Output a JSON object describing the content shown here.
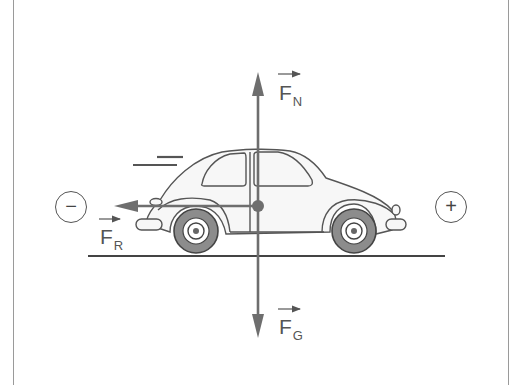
{
  "diagram": {
    "forces": {
      "normal": {
        "symbol": "F",
        "subscript": "N",
        "direction": "up"
      },
      "gravity": {
        "symbol": "F",
        "subscript": "G",
        "direction": "down"
      },
      "resistance": {
        "symbol": "F",
        "subscript": "R",
        "direction": "left"
      }
    },
    "direction_signs": {
      "negative": "−",
      "positive": "+"
    },
    "colors": {
      "arrow": "#6e6e6e",
      "outline": "#555555",
      "tire": "#8c8c8c",
      "ground": "#444444",
      "border": "#9a9a9a"
    }
  }
}
